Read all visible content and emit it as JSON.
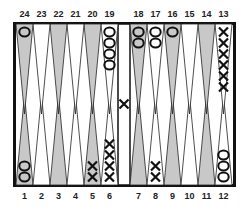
{
  "game": "backgammon",
  "colors": {
    "border": "#111111",
    "shaded_point": "#c8c8c8",
    "light_point": "#ffffff",
    "checker_stroke": "#111111"
  },
  "labels": {
    "top": [
      "24",
      "23",
      "22",
      "21",
      "20",
      "19",
      "18",
      "17",
      "16",
      "15",
      "14",
      "13"
    ],
    "bottom": [
      "1",
      "2",
      "3",
      "4",
      "5",
      "6",
      "7",
      "8",
      "9",
      "10",
      "11",
      "12"
    ]
  },
  "points": [
    {
      "point": 1,
      "player": "O",
      "count": 2
    },
    {
      "point": 5,
      "player": "X",
      "count": 2
    },
    {
      "point": 6,
      "player": "X",
      "count": 4
    },
    {
      "point": 8,
      "player": "X",
      "count": 2
    },
    {
      "point": 12,
      "player": "O",
      "count": 3
    },
    {
      "point": 13,
      "player": "X",
      "count": 6
    },
    {
      "point": 16,
      "player": "O",
      "count": 1
    },
    {
      "point": 17,
      "player": "O",
      "count": 2
    },
    {
      "point": 18,
      "player": "O",
      "count": 2
    },
    {
      "point": 19,
      "player": "O",
      "count": 4
    },
    {
      "point": 24,
      "player": "O",
      "count": 1
    }
  ],
  "bar": [
    {
      "player": "X",
      "count": 1
    }
  ]
}
